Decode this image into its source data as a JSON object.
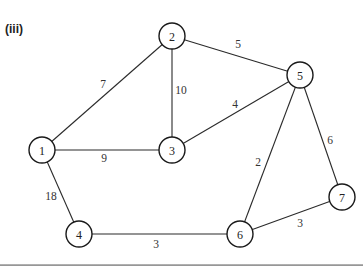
{
  "figure": {
    "part_label": "(iii)",
    "nodes": [
      {
        "id": "1",
        "label": "1",
        "x": 42,
        "y": 150
      },
      {
        "id": "2",
        "label": "2",
        "x": 172,
        "y": 36
      },
      {
        "id": "3",
        "label": "3",
        "x": 172,
        "y": 150
      },
      {
        "id": "4",
        "label": "4",
        "x": 79,
        "y": 234
      },
      {
        "id": "5",
        "label": "5",
        "x": 300,
        "y": 75
      },
      {
        "id": "6",
        "label": "6",
        "x": 240,
        "y": 234
      },
      {
        "id": "7",
        "label": "7",
        "x": 342,
        "y": 197
      }
    ],
    "edges": [
      {
        "from": "1",
        "to": "2",
        "weight": "7",
        "lx": 103,
        "ly": 84
      },
      {
        "from": "2",
        "to": "5",
        "weight": "5",
        "lx": 238,
        "ly": 44
      },
      {
        "from": "2",
        "to": "3",
        "weight": "10",
        "lx": 181,
        "ly": 90
      },
      {
        "from": "3",
        "to": "5",
        "weight": "4",
        "lx": 235,
        "ly": 104
      },
      {
        "from": "1",
        "to": "3",
        "weight": "9",
        "lx": 104,
        "ly": 158
      },
      {
        "from": "1",
        "to": "4",
        "weight": "18",
        "lx": 51,
        "ly": 196
      },
      {
        "from": "5",
        "to": "6",
        "weight": "2",
        "lx": 258,
        "ly": 162
      },
      {
        "from": "5",
        "to": "7",
        "weight": "6",
        "lx": 330,
        "ly": 140
      },
      {
        "from": "4",
        "to": "6",
        "weight": "3",
        "lx": 156,
        "ly": 244
      },
      {
        "from": "6",
        "to": "7",
        "weight": "3",
        "lx": 300,
        "ly": 223
      }
    ]
  }
}
